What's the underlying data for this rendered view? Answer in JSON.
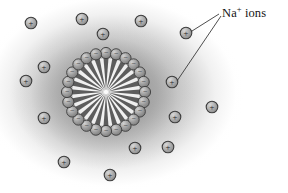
{
  "figure": {
    "background_color": "#ffffff",
    "haze_color": "#969696",
    "width": 288,
    "height": 193
  },
  "annotation": {
    "label_prefix": "Na",
    "label_superscript": "+",
    "label_suffix": " ions",
    "label_full": "Na+ ions",
    "label_x": 222,
    "label_y": 6,
    "line_color": "#3a3a3a",
    "leaders": [
      {
        "name": "leader-to-upper-ion",
        "x1": 219,
        "y1": 14,
        "x2": 192,
        "y2": 31
      },
      {
        "name": "leader-to-lower-ion",
        "x1": 221,
        "y1": 16,
        "x2": 177,
        "y2": 81
      }
    ]
  },
  "micelle": {
    "center_x": 106,
    "center_y": 92,
    "head_ring_radius": 39,
    "head_radius": 5.6,
    "head_count": 24,
    "head_charge": "−",
    "head_fill": "#9a9a9a",
    "head_stroke": "#3c3c3c",
    "tail_color": "#5d5d5d",
    "core_fill": "#f2f2f2",
    "core_radius": 34,
    "tail_inner_radius": 2,
    "tail_outer_radius": 34,
    "tail_half_angle_deg": 4.2
  },
  "ions": {
    "charge": "+",
    "radius": 5.8,
    "fill": "#a8a8a8",
    "stroke": "#3c3c3c",
    "text_color": "#232323",
    "positions": [
      {
        "name": "ion-1",
        "x": 31,
        "y": 23
      },
      {
        "name": "ion-2",
        "x": 82,
        "y": 19
      },
      {
        "name": "ion-3",
        "x": 103,
        "y": 34
      },
      {
        "name": "ion-4",
        "x": 141,
        "y": 21
      },
      {
        "name": "ion-5",
        "x": 186,
        "y": 33
      },
      {
        "name": "ion-6",
        "x": 44,
        "y": 67
      },
      {
        "name": "ion-7",
        "x": 26,
        "y": 81
      },
      {
        "name": "ion-8",
        "x": 172,
        "y": 82
      },
      {
        "name": "ion-9",
        "x": 212,
        "y": 107
      },
      {
        "name": "ion-10",
        "x": 44,
        "y": 118
      },
      {
        "name": "ion-11",
        "x": 175,
        "y": 117
      },
      {
        "name": "ion-12",
        "x": 135,
        "y": 148
      },
      {
        "name": "ion-13",
        "x": 168,
        "y": 147
      },
      {
        "name": "ion-14",
        "x": 64,
        "y": 162
      },
      {
        "name": "ion-15",
        "x": 110,
        "y": 175
      }
    ]
  }
}
